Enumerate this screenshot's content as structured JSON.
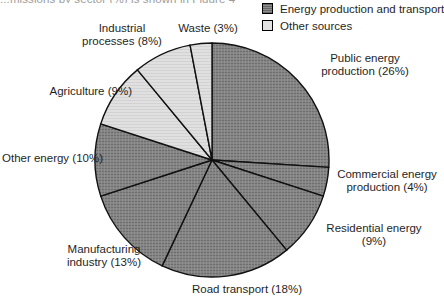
{
  "document": {
    "top_text": "...missions by sector (%) is shown in Figure 4"
  },
  "legend": {
    "position": "top-right",
    "items": [
      {
        "label": "Energy production and transport",
        "swatch": "dark-gray-swatch",
        "color": "#7d7d7d"
      },
      {
        "label": "Other sources",
        "swatch": "light-gray-swatch",
        "color": "#e2e2e2"
      }
    ]
  },
  "chart_data": {
    "type": "pie",
    "title": "",
    "subtitle": "",
    "xlabel": "",
    "ylabel": "",
    "grid": false,
    "legend_position": "top-right",
    "start_angle_deg": 0,
    "direction": "clockwise",
    "unit": "%",
    "groups": [
      {
        "name": "Energy production and transport",
        "color": "#7d7d7d"
      },
      {
        "name": "Other sources",
        "color": "#e2e2e2"
      }
    ],
    "categories": [
      "Public energy production",
      "Commercial energy production",
      "Residential energy",
      "Road transport",
      "Manufacturing industry",
      "Other energy",
      "Agriculture",
      "Industrial processes",
      "Waste"
    ],
    "values": [
      26,
      4,
      9,
      18,
      13,
      10,
      9,
      8,
      3
    ],
    "slices": [
      {
        "label": "Public energy production (26%)",
        "name": "Public energy production",
        "value": 26,
        "group": "Energy production and transport",
        "color": "#7d7d7d"
      },
      {
        "label": "Commercial energy production (4%)",
        "name": "Commercial energy production",
        "value": 4,
        "group": "Energy production and transport",
        "color": "#7d7d7d"
      },
      {
        "label": "Residential energy (9%)",
        "name": "Residential energy",
        "value": 9,
        "group": "Energy production and transport",
        "color": "#7d7d7d"
      },
      {
        "label": "Road transport (18%)",
        "name": "Road transport",
        "value": 18,
        "group": "Energy production and transport",
        "color": "#7d7d7d"
      },
      {
        "label": "Manufacturing industry (13%)",
        "name": "Manufacturing industry",
        "value": 13,
        "group": "Energy production and transport",
        "color": "#7d7d7d"
      },
      {
        "label": "Other energy (10%)",
        "name": "Other energy",
        "value": 10,
        "group": "Energy production and transport",
        "color": "#7d7d7d"
      },
      {
        "label": "Agriculture (9%)",
        "name": "Agriculture",
        "value": 9,
        "group": "Other sources",
        "color": "#e2e2e2"
      },
      {
        "label": "Industrial processes (8%)",
        "name": "Industrial processes",
        "value": 8,
        "group": "Other sources",
        "color": "#e2e2e2"
      },
      {
        "label": "Waste (3%)",
        "name": "Waste",
        "value": 3,
        "group": "Other sources",
        "color": "#e2e2e2"
      }
    ]
  },
  "labels": {
    "industrial_processes": "Industrial\nprocesses (8%)",
    "industrial_processes_line1": "Industrial",
    "industrial_processes_line2": "processes (8%)",
    "waste": "Waste (3%)",
    "agriculture": "Agriculture (9%)",
    "other_energy": "Other energy (10%)",
    "manufacturing_line1": "Manufacturing",
    "manufacturing_line2": "industry (13%)",
    "road_transport": "Road transport (18%)",
    "residential_line1": "Residential energy",
    "residential_line2": "(9%)",
    "commercial_line1": "Commercial energy",
    "commercial_line2": "production (4%)",
    "public_line1": "Public energy",
    "public_line2": "production (26%)"
  }
}
